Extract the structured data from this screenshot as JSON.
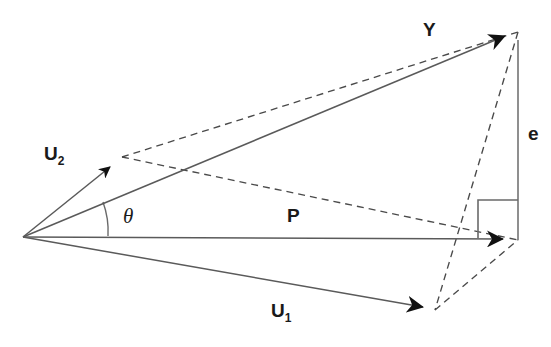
{
  "figure": {
    "type": "vector-decomposition-diagram",
    "background_color": "#ffffff",
    "stroke_color": "#555555",
    "label_color": "#1a1a1a",
    "labels": {
      "u2": "U",
      "u2_sub": "2",
      "u1": "U",
      "u1_sub": "1",
      "p": "P",
      "y": "Y",
      "e": "e",
      "theta": "θ"
    },
    "geometry": {
      "origin": [
        23,
        237
      ],
      "points": {
        "y_tip": [
          518,
          32
        ],
        "p_tip": [
          518,
          240
        ],
        "u2_tip": [
          122,
          157
        ],
        "u1_tip": [
          435,
          310
        ]
      },
      "solid_edges": [
        {
          "name": "origin-to-y",
          "from": [
            23,
            237
          ],
          "to": [
            518,
            32
          ]
        },
        {
          "name": "origin-to-p",
          "from": [
            23,
            237
          ],
          "to": [
            518,
            240
          ]
        },
        {
          "name": "origin-to-u2",
          "from": [
            23,
            237
          ],
          "to": [
            122,
            157
          ]
        },
        {
          "name": "origin-to-u1",
          "from": [
            23,
            237
          ],
          "to": [
            435,
            310
          ]
        },
        {
          "name": "e-segment",
          "from": [
            518,
            32
          ],
          "to": [
            518,
            240
          ]
        }
      ],
      "dashed_edges": [
        {
          "name": "u2-to-y",
          "from": [
            122,
            157
          ],
          "to": [
            518,
            32
          ]
        },
        {
          "name": "u2-to-p",
          "from": [
            122,
            157
          ],
          "to": [
            518,
            240
          ]
        },
        {
          "name": "y-to-u1",
          "from": [
            518,
            32
          ],
          "to": [
            435,
            310
          ]
        },
        {
          "name": "u1-to-p",
          "from": [
            435,
            310
          ],
          "to": [
            518,
            240
          ]
        }
      ],
      "right_angle_marker": {
        "x": 478,
        "y": 200,
        "size": 38
      },
      "angle_arc": {
        "center": [
          23,
          237
        ],
        "radius": 85,
        "between": [
          "origin-to-p",
          "origin-to-y"
        ]
      }
    }
  }
}
